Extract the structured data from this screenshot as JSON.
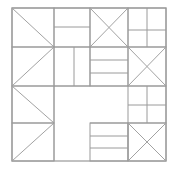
{
  "figure": {
    "canvas": {
      "width": 176,
      "height": 170
    },
    "colors": {
      "background": "#ffffff",
      "line": "#9a9a9a",
      "outline": "#8e8e8e",
      "diagonal": "#a2a2a2"
    },
    "bounds": {
      "left": 12,
      "top": 8,
      "right": 166,
      "bottom": 161
    },
    "grid": {
      "x_stops": [
        12,
        54,
        90,
        128,
        166
      ],
      "y_stops": [
        8,
        47,
        86,
        123,
        161
      ]
    },
    "blocks": [
      {
        "name": "top-left-half-square-triangle",
        "rect": [
          12,
          8,
          54,
          47
        ],
        "motif": "diagonal-tl-br"
      },
      {
        "name": "top-left-inner-bar",
        "rect": [
          54,
          8,
          90,
          47
        ],
        "motif": "horizontal-bar"
      },
      {
        "name": "top-center-hourglass",
        "rect": [
          90,
          8,
          128,
          47
        ],
        "motif": "x-cross"
      },
      {
        "name": "top-right-four-patch",
        "rect": [
          128,
          8,
          166,
          47
        ],
        "motif": "four-patch"
      },
      {
        "name": "left-mid-half-square-triangle",
        "rect": [
          12,
          47,
          54,
          86
        ],
        "motif": "diagonal-bl-tr"
      },
      {
        "name": "center-left-vertical-bar",
        "rect": [
          54,
          47,
          74,
          86
        ],
        "motif": "vertical-bar"
      },
      {
        "name": "center-stripes",
        "rect": [
          90,
          47,
          128,
          86
        ],
        "motif": "horizontal-stripes-3"
      },
      {
        "name": "right-mid-flying-geese",
        "rect": [
          128,
          47,
          166,
          86
        ],
        "motif": "half-triangle-left"
      },
      {
        "name": "bottom-left-upper-triangle",
        "rect": [
          12,
          86,
          54,
          123
        ],
        "motif": "diagonal-tl-br"
      },
      {
        "name": "bottom-left-lower-triangle",
        "rect": [
          12,
          123,
          54,
          161
        ],
        "motif": "diagonal-bl-tr"
      },
      {
        "name": "right-lower-four-patch",
        "rect": [
          128,
          86,
          166,
          123
        ],
        "motif": "four-patch"
      },
      {
        "name": "bottom-center-stripes",
        "rect": [
          90,
          123,
          128,
          161
        ],
        "motif": "horizontal-stripes-3"
      },
      {
        "name": "bottom-right-hourglass",
        "rect": [
          128,
          123,
          166,
          161
        ],
        "motif": "x-cross"
      }
    ],
    "notch": {
      "name": "center-bottom-negative-space",
      "rect": [
        54,
        86,
        128,
        123
      ],
      "motif": "empty"
    }
  }
}
